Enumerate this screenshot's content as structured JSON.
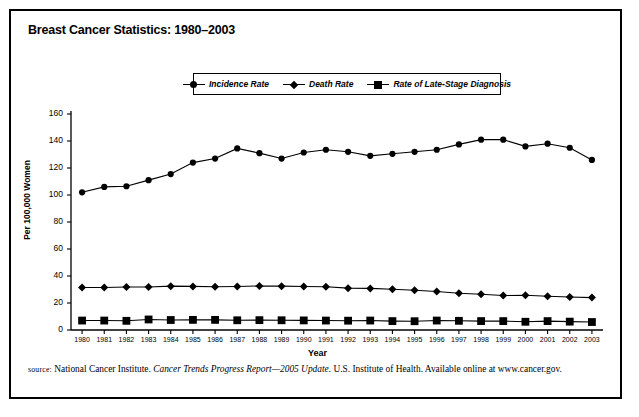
{
  "figure": {
    "title": "Breast Cancer Statistics: 1980–2003",
    "source_prefix": "source:",
    "source_text_1": " National Cancer Institute. ",
    "source_italic": "Cancer Trends Progress Report—2005 Update.",
    "source_text_2": " U.S. Institute of Health. Available online at www.cancer.gov."
  },
  "legend": {
    "items": [
      {
        "label": "Incidence Rate",
        "marker": "circle-marker-icon"
      },
      {
        "label": "Death Rate",
        "marker": "diamond-marker-icon"
      },
      {
        "label": "Rate of Late-Stage Diagnosis",
        "marker": "square-marker-icon"
      }
    ]
  },
  "chart_data": {
    "type": "line",
    "title": "Breast Cancer Statistics: 1980–2003",
    "xlabel": "Year",
    "ylabel": "Per 100,000 Women",
    "ylim": [
      0,
      160
    ],
    "yticks": [
      0,
      20,
      40,
      60,
      80,
      100,
      120,
      140,
      160
    ],
    "grid": false,
    "legend_position": "top-center",
    "categories": [
      "1980",
      "1981",
      "1982",
      "1983",
      "1984",
      "1985",
      "1986",
      "1987",
      "1988",
      "1989",
      "1990",
      "1991",
      "1992",
      "1993",
      "1994",
      "1995",
      "1996",
      "1997",
      "1998",
      "1999",
      "2000",
      "2001",
      "2002",
      "2003"
    ],
    "series": [
      {
        "name": "Incidence Rate",
        "marker": "circle",
        "values": [
          102,
          106,
          106.5,
          111,
          115.5,
          124,
          127,
          134.5,
          131,
          127,
          131.5,
          133.5,
          132,
          129,
          130.5,
          132,
          133.5,
          137.5,
          141,
          141,
          136,
          138,
          135,
          126
        ]
      },
      {
        "name": "Death Rate",
        "marker": "diamond",
        "values": [
          31.5,
          31.5,
          31.8,
          31.8,
          32.5,
          32.3,
          32,
          32.2,
          32.6,
          32.5,
          32.2,
          32,
          31,
          30.8,
          30.2,
          29.5,
          28.5,
          27.2,
          26.5,
          25.5,
          25.7,
          25,
          24.4,
          24
        ]
      },
      {
        "name": "Rate of Late-Stage Diagnosis",
        "marker": "square",
        "values": [
          7,
          7,
          6.8,
          7.8,
          7.4,
          7.5,
          7.5,
          7.2,
          7.3,
          7.2,
          7.1,
          7,
          6.9,
          7,
          6.6,
          6.5,
          7,
          6.8,
          6.6,
          6.6,
          6.1,
          6.6,
          6.2,
          5.9
        ]
      }
    ]
  }
}
